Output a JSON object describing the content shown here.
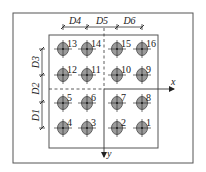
{
  "diagram": {
    "colors": {
      "line": "#333333",
      "frame": "#555555",
      "hole_fill": "#9a9a9a",
      "hole_stroke": "#444444"
    },
    "outer_frame": {
      "x": 13,
      "y": 13,
      "w": 180,
      "h": 150
    },
    "inner_box": {
      "x": 49,
      "y": 35,
      "w": 109,
      "h": 113
    },
    "axes": {
      "origin": {
        "x": 104,
        "y": 89
      },
      "x_label": "x",
      "y_label": "y",
      "x_end": 174,
      "y_end": 157,
      "x_start": 49,
      "y_start": 28
    },
    "dimensions_top": {
      "y": 27,
      "ticks": [
        63,
        87,
        117,
        142
      ],
      "labels": [
        "D4",
        "D5",
        "D6"
      ]
    },
    "dimensions_left": {
      "x": 42,
      "ticks": [
        49,
        75,
        102,
        128
      ],
      "labels": [
        "D3",
        "D2",
        "D1"
      ]
    },
    "holes": [
      {
        "id": "13",
        "x": 63,
        "y": 49
      },
      {
        "id": "14",
        "x": 87,
        "y": 49
      },
      {
        "id": "15",
        "x": 117,
        "y": 49
      },
      {
        "id": "16",
        "x": 142,
        "y": 49
      },
      {
        "id": "12",
        "x": 63,
        "y": 75
      },
      {
        "id": "11",
        "x": 87,
        "y": 75
      },
      {
        "id": "10",
        "x": 117,
        "y": 75
      },
      {
        "id": "9",
        "x": 142,
        "y": 75
      },
      {
        "id": "5",
        "x": 63,
        "y": 103
      },
      {
        "id": "6",
        "x": 87,
        "y": 103
      },
      {
        "id": "7",
        "x": 117,
        "y": 103
      },
      {
        "id": "8",
        "x": 142,
        "y": 103
      },
      {
        "id": "4",
        "x": 63,
        "y": 128
      },
      {
        "id": "3",
        "x": 87,
        "y": 128
      },
      {
        "id": "2",
        "x": 117,
        "y": 128
      },
      {
        "id": "1",
        "x": 142,
        "y": 128
      }
    ]
  }
}
